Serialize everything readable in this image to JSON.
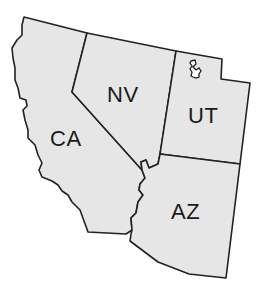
{
  "map": {
    "title": "",
    "region": "Southwestern United States",
    "fill_color": "#e6e6e6",
    "border_color": "#222222",
    "background": "#ffffff",
    "states": [
      {
        "abbr": "CA",
        "name": "California"
      },
      {
        "abbr": "NV",
        "name": "Nevada"
      },
      {
        "abbr": "UT",
        "name": "Utah"
      },
      {
        "abbr": "AZ",
        "name": "Arizona"
      }
    ],
    "features": [
      {
        "name": "Great Salt Lake",
        "state": "UT"
      }
    ]
  }
}
